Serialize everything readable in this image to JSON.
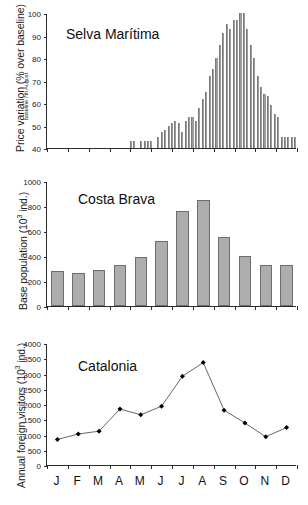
{
  "figure": {
    "width": 308,
    "height": 505,
    "bar_color": "#a8a8a8",
    "line_color": "#555555",
    "marker_color": "#000000",
    "axis_color": "#2b2b2b"
  },
  "panels": [
    {
      "key": "selva",
      "title": "Selva Marítima",
      "ylabel_main": "Price variation (% over baseline)",
      "ylabel_sub": "baseline 7th August",
      "ylabel_sub_sup": "th"
    },
    {
      "key": "costa",
      "title": "Costa Brava",
      "ylabel_main": "Base population (10",
      "ylabel_sup": "3",
      "ylabel_tail": " ind.)"
    },
    {
      "key": "catalonia",
      "title": "Catalonia",
      "ylabel_main": "Annual foreign visitors (10",
      "ylabel_sup": "3",
      "ylabel_tail": " ind.)"
    }
  ],
  "xaxis": {
    "labels": [
      "J",
      "F",
      "M",
      "A",
      "M",
      "J",
      "J",
      "A",
      "S",
      "O",
      "N",
      "D"
    ],
    "label_full": [
      "January",
      "February",
      "March",
      "April",
      "May",
      "June",
      "July",
      "August",
      "September",
      "October",
      "November",
      "December"
    ]
  },
  "chart_data": [
    {
      "type": "bar",
      "key": "selva",
      "title": "Selva Marítima",
      "xlabel": "",
      "ylabel": "Price variation (% over baseline)",
      "ylabel_note": "baseline 7th August",
      "ylim": [
        40,
        100
      ],
      "yticks": [
        40,
        50,
        60,
        70,
        80,
        90,
        100
      ],
      "grid": false,
      "categories": [
        "J",
        "F",
        "M",
        "A",
        "M",
        "J",
        "J",
        "A",
        "S",
        "O",
        "N",
        "D"
      ],
      "x_unit": "day-of-year (daily bars across 12 months)",
      "n_bars": 73,
      "values": [
        40,
        40,
        40,
        40,
        40,
        40,
        40,
        40,
        40,
        40,
        40,
        40,
        40,
        40,
        40,
        40,
        40,
        40,
        40,
        40,
        40,
        40,
        40,
        40,
        43,
        43,
        40,
        43,
        43,
        43,
        43,
        40,
        45,
        47,
        48,
        50,
        51,
        52,
        51,
        47,
        52,
        54,
        54,
        52,
        58,
        62,
        65,
        72,
        75,
        80,
        86,
        91,
        95,
        93,
        97,
        97,
        100,
        100,
        93,
        86,
        80,
        72,
        67,
        64,
        63,
        59,
        55,
        54,
        45,
        45,
        45,
        45,
        45
      ],
      "peak_value": 100,
      "peak_period": "early August",
      "baseline_value": 40
    },
    {
      "type": "bar",
      "key": "costa",
      "title": "Costa Brava",
      "xlabel": "",
      "ylabel": "Base population (10³ ind.)",
      "ylim": [
        0,
        1000
      ],
      "yticks": [
        0,
        200,
        400,
        600,
        800,
        1000
      ],
      "grid": false,
      "categories": [
        "J",
        "F",
        "M",
        "A",
        "M",
        "J",
        "J",
        "A",
        "S",
        "O",
        "N",
        "D"
      ],
      "values": [
        280,
        265,
        290,
        330,
        390,
        520,
        760,
        850,
        555,
        400,
        330,
        330
      ]
    },
    {
      "type": "line",
      "key": "catalonia",
      "title": "Catalonia",
      "xlabel": "",
      "ylabel": "Annual foreign visitors (10³ ind.)",
      "ylim": [
        0,
        4000
      ],
      "yticks": [
        0,
        500,
        1000,
        1500,
        2000,
        2500,
        3000,
        3500,
        4000
      ],
      "grid": false,
      "categories": [
        "J",
        "F",
        "M",
        "A",
        "M",
        "J",
        "J",
        "A",
        "S",
        "O",
        "N",
        "D"
      ],
      "values": [
        870,
        1050,
        1140,
        1870,
        1680,
        1960,
        2940,
        3390,
        1830,
        1410,
        960,
        1260
      ],
      "marker": "filled-diamond",
      "legend": "none"
    }
  ]
}
